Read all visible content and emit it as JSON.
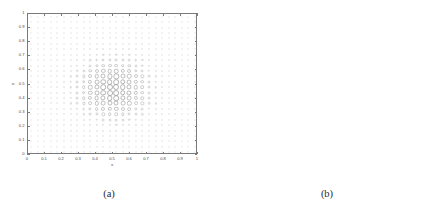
{
  "figure": {
    "background": "#ffffff",
    "axis_color": "#7a7a7a",
    "text_color": "#4a4a4a",
    "marker_color": "#9a9a9a",
    "spy_color": "#58585a"
  },
  "panel_a": {
    "caption": "(a)",
    "xlabel": "x",
    "ylabel": "y",
    "xticks": [
      "0",
      "0.1",
      "0.2",
      "0.3",
      "0.4",
      "0.5",
      "0.6",
      "0.7",
      "0.8",
      "0.9",
      "1"
    ],
    "yticks": [
      "0",
      "0.1",
      "0.2",
      "0.3",
      "0.4",
      "0.5",
      "0.6",
      "0.7",
      "0.8",
      "0.9",
      "1"
    ]
  },
  "panel_b": {
    "caption": "(b)",
    "nz_label": "nz = 37212",
    "xticks": [
      "0",
      "100",
      "200",
      "300",
      "400",
      "500",
      "600"
    ],
    "yticks": [
      "0",
      "100",
      "200",
      "300",
      "400",
      "500",
      "600"
    ]
  },
  "chart_data": [
    {
      "type": "scatter",
      "title": "",
      "subtitle": "",
      "panel": "a",
      "xlabel": "x",
      "ylabel": "y",
      "xlim": [
        0,
        1
      ],
      "ylim": [
        0,
        1
      ],
      "xticks": [
        0,
        0.1,
        0.2,
        0.3,
        0.4,
        0.5,
        0.6,
        0.7,
        0.8,
        0.9,
        1
      ],
      "yticks": [
        0,
        0.1,
        0.2,
        0.3,
        0.4,
        0.5,
        0.6,
        0.7,
        0.8,
        0.9,
        1
      ],
      "grid": false,
      "legend": null,
      "description": "Uniform 26x26 grid of circular markers over the unit square; marker size/darkness is largest near the centre (0.5,0.5) and decays toward the boundary, forming a radially-graded adaptive-mesh / basis-support pattern.",
      "grid_nx": 26,
      "grid_ny": 26,
      "size_field": {
        "model": "radial_gaussian",
        "center": [
          0.5,
          0.47
        ],
        "peak_radius_px": 3.0,
        "min_radius_px": 0.55,
        "sigma": 0.155
      }
    },
    {
      "type": "scatter",
      "title": "",
      "subtitle": "",
      "panel": "b",
      "xlabel": "nz = 37212",
      "ylabel": "",
      "xlim": [
        0,
        625
      ],
      "ylim": [
        625,
        0
      ],
      "xticks": [
        0,
        100,
        200,
        300,
        400,
        500,
        600
      ],
      "yticks": [
        0,
        100,
        200,
        300,
        400,
        500,
        600
      ],
      "grid": false,
      "legend": null,
      "nz": 37212,
      "matrix_size": 625,
      "description": "MATLAB spy plot of a sparse matrix. A wide anti-diagonal band of about 8 parallel stripes runs from the top-left (0,0) to the bottom-right (625,625). A separate lower structure near rows 540-620 consists of short descending diagonal dashes from x=0 to about x=150, then an almost horizontal chain of dots to about x=500, then a second group of short diagonal dashes to the right edge.",
      "band": {
        "stripe_count": 8,
        "stripe_spacing": 25,
        "stripe_offsets": [
          0,
          25,
          50,
          75,
          100,
          125,
          150,
          175
        ],
        "stripe_thickness": 7,
        "orientation": "anti-diagonal"
      },
      "lower_structure": {
        "rows": [
          540,
          620
        ],
        "segments": [
          "descending-dashes",
          "horizontal-dot-chain",
          "descending-dashes"
        ]
      }
    }
  ]
}
